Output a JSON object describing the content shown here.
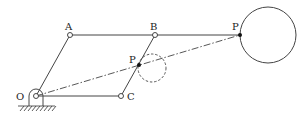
{
  "diagram": {
    "type": "pantograph-linkage",
    "colors": {
      "line": "#333333",
      "background": "#ffffff"
    },
    "labels": {
      "O": "O",
      "A": "A",
      "B": "B",
      "C": "C",
      "P_small": "P",
      "P_large": "P"
    },
    "joints": [
      "O",
      "A",
      "B",
      "C"
    ],
    "links": [
      "O-A",
      "A-B",
      "B-C",
      "C-O",
      "B-P"
    ],
    "traced_paths": [
      "small dashed circle (input)",
      "large solid circle (output)"
    ],
    "ground_support": "fixed pivot at O"
  }
}
